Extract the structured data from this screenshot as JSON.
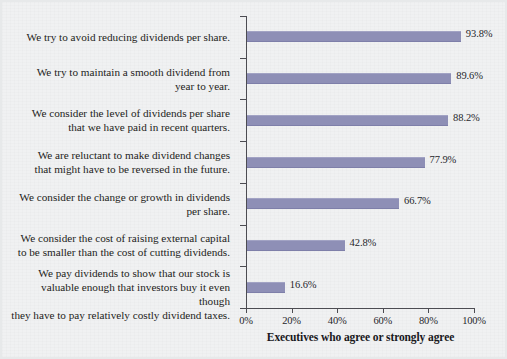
{
  "chart_data": {
    "type": "bar",
    "orientation": "horizontal",
    "title": "",
    "xlabel": "Executives who agree or strongly agree",
    "ylabel": "",
    "xlim": [
      0,
      100
    ],
    "xticks": [
      "0%",
      "20%",
      "40%",
      "60%",
      "80%",
      "100%"
    ],
    "xtick_values": [
      0,
      20,
      40,
      60,
      80,
      100
    ],
    "grid": false,
    "legend": null,
    "bar_color": "#8e8fb6",
    "background_color": "#f0f1f2",
    "categories": [
      "We try to avoid reducing dividends per share.",
      "We try to maintain a smooth dividend from year to year.",
      "We consider the level of dividends per share that we have paid in recent quarters.",
      "We are reluctant to make dividend changes that might have to be reversed in the future.",
      "We consider the change or growth in dividends per share.",
      "We consider the cost of raising external capital to be smaller than the cost of cutting dividends.",
      "We pay dividends to show that our stock is valuable enough that investors buy it even though they have to pay relatively costly dividend taxes."
    ],
    "category_lines": [
      [
        "We try to avoid reducing dividends per share."
      ],
      [
        "We try to maintain a smooth dividend from",
        "year to year."
      ],
      [
        "We consider the level of dividends per share",
        "that we have paid in recent quarters."
      ],
      [
        "We are reluctant to make dividend changes",
        "that might have to be reversed in the future."
      ],
      [
        "We consider the change or growth in dividends",
        "per share."
      ],
      [
        "We consider the cost of raising external capital",
        "to be smaller than the cost of cutting dividends."
      ],
      [
        "We pay dividends to show that our stock is",
        "valuable enough that investors buy it even though",
        "they have to pay relatively costly dividend taxes."
      ]
    ],
    "values": [
      93.8,
      89.6,
      88.2,
      77.9,
      66.7,
      42.8,
      16.6
    ],
    "value_labels": [
      "93.8%",
      "89.6%",
      "88.2%",
      "77.9%",
      "66.7%",
      "42.8%",
      "16.6%"
    ]
  }
}
